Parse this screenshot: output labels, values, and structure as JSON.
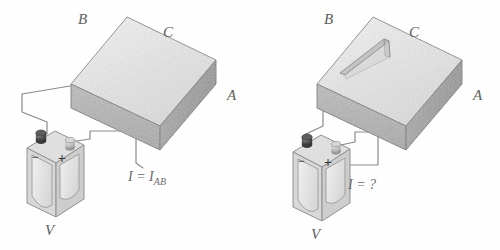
{
  "figure": {
    "background_color": "#fefefe",
    "panels": [
      {
        "id": "left",
        "caption_current": "I = I",
        "caption_current_sub": "AB",
        "block": {
          "label_b": "B",
          "label_c": "C",
          "label_a": "A",
          "top_face_color": "#ececec",
          "front_face_color": "#b3b3b3",
          "right_face_color": "#a2a2a2",
          "edge_color": "#7d7d7d",
          "has_slot": false
        },
        "battery": {
          "label": "V",
          "negative_sign": "−",
          "positive_sign": "+",
          "body_color": "#dcdcdc",
          "cell_color": "#e8e8e8",
          "neg_post_color": "#4a4a4a",
          "pos_post_color": "#b9b9b9"
        },
        "wire_color": "#8a8a8a"
      },
      {
        "id": "right",
        "caption_current": "I = ?",
        "caption_current_sub": "",
        "block": {
          "label_b": "B",
          "label_c": "C",
          "label_a": "A",
          "top_face_color": "#ececec",
          "front_face_color": "#b3b3b3",
          "right_face_color": "#a2a2a2",
          "edge_color": "#7d7d7d",
          "has_slot": true,
          "slot_color": "#c9c9c9"
        },
        "battery": {
          "label": "V",
          "negative_sign": "−",
          "positive_sign": "+",
          "body_color": "#dcdcdc",
          "cell_color": "#e8e8e8",
          "neg_post_color": "#4a4a4a",
          "pos_post_color": "#b9b9b9"
        },
        "wire_color": "#8a8a8a"
      }
    ]
  }
}
